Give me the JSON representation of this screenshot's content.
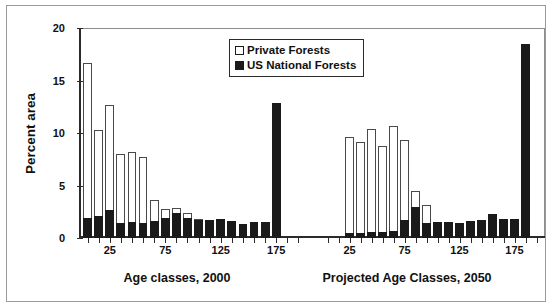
{
  "chart_data": {
    "type": "bar",
    "title": "",
    "subtitle": "",
    "xlabel": "",
    "ylabel": "Percent area",
    "ylim": [
      0,
      20
    ],
    "yticks": [
      0,
      5,
      10,
      15,
      20
    ],
    "grid": false,
    "stacked": true,
    "legend": {
      "position": "top-center",
      "entries": [
        {
          "label": "Private Forests",
          "swatch": "open-square",
          "color": "#ffffff"
        },
        {
          "label": "US National Forests",
          "swatch": "filled-square",
          "color": "#1a1a1a"
        }
      ]
    },
    "panels": [
      {
        "name": "age-classes-2000",
        "caption": "Age classes, 2000",
        "xticks_labeled": [
          25,
          75,
          125,
          175
        ],
        "x_categories": [
          "5",
          "15",
          "25",
          "35",
          "45",
          "55",
          "65",
          "75",
          "85",
          "95",
          "105",
          "115",
          "125",
          "135",
          "145",
          "155",
          "165",
          "175",
          "185",
          "195"
        ],
        "series": [
          {
            "name": "US National Forests",
            "color": "#1a1a1a",
            "values": [
              1.9,
              2.1,
              2.7,
              1.4,
              1.5,
              1.4,
              1.6,
              1.9,
              2.4,
              1.9,
              1.7,
              1.7,
              1.8,
              1.6,
              1.3,
              1.5,
              1.5,
              12.9,
              0.0,
              0.0
            ]
          },
          {
            "name": "Private Forests",
            "color": "#ffffff",
            "values": [
              14.8,
              8.2,
              10.0,
              6.6,
              6.7,
              6.3,
              2.0,
              0.9,
              0.5,
              0.5,
              0.1,
              0.0,
              0.0,
              0.0,
              0.0,
              0.0,
              0.0,
              0.0,
              0.0,
              0.0
            ]
          }
        ],
        "totals": [
          16.7,
          10.3,
          12.7,
          8.0,
          8.2,
          7.7,
          3.6,
          2.8,
          2.9,
          2.4,
          1.8,
          1.7,
          1.8,
          1.6,
          1.3,
          1.5,
          1.5,
          12.9,
          0.0,
          0.0
        ]
      },
      {
        "name": "projected-age-classes-2050",
        "caption": "Projected Age Classes, 2050",
        "xticks_labeled": [
          25,
          75,
          125,
          175
        ],
        "x_categories": [
          "5",
          "15",
          "25",
          "35",
          "45",
          "55",
          "65",
          "75",
          "85",
          "95",
          "105",
          "115",
          "125",
          "135",
          "145",
          "155",
          "165",
          "175",
          "185",
          "195"
        ],
        "series": [
          {
            "name": "US National Forests",
            "color": "#1a1a1a",
            "values": [
              0.0,
              0.0,
              0.5,
              0.5,
              0.6,
              0.6,
              0.7,
              1.7,
              3.0,
              1.4,
              1.5,
              1.5,
              1.4,
              1.6,
              1.7,
              2.3,
              1.8,
              1.8,
              18.5,
              0.0
            ]
          },
          {
            "name": "Private Forests",
            "color": "#ffffff",
            "values": [
              0.0,
              0.0,
              9.1,
              8.6,
              9.8,
              8.2,
              10.0,
              7.6,
              1.5,
              1.7,
              0.0,
              0.0,
              0.0,
              0.0,
              0.0,
              0.0,
              0.0,
              0.0,
              0.0,
              0.0
            ]
          }
        ],
        "totals": [
          0.0,
          0.0,
          9.6,
          9.1,
          10.4,
          8.8,
          10.7,
          9.3,
          4.5,
          3.1,
          1.5,
          1.5,
          1.4,
          1.6,
          1.7,
          2.3,
          1.8,
          1.8,
          18.5,
          0.0
        ]
      }
    ]
  },
  "axis": {
    "y_title": "Percent area",
    "y_tick_labels": [
      "0",
      "5",
      "10",
      "15",
      "20"
    ]
  },
  "legend": {
    "private_label": "Private Forests",
    "national_label": "US National Forests"
  },
  "captions": {
    "left": "Age classes, 2000",
    "right": "Projected Age Classes, 2050"
  },
  "xtick_labels": {
    "left": [
      "25",
      "75",
      "125",
      "175"
    ],
    "right": [
      "25",
      "75",
      "125",
      "175"
    ]
  },
  "colors": {
    "private": "#ffffff",
    "national": "#1a1a1a",
    "axis": "#2b2b2b",
    "frame": "#9a9a9a"
  }
}
